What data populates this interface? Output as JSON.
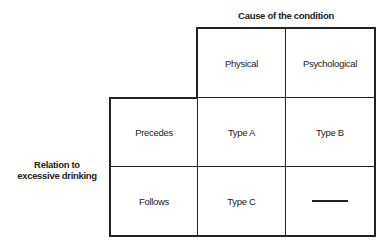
{
  "diagram": {
    "column_header_title": "Cause of the condition",
    "row_header_title_lines": [
      "Relation to",
      "excessive drinking"
    ],
    "columns": [
      "Physical",
      "Psychological"
    ],
    "rows": [
      {
        "label": "Precedes",
        "cells": [
          "Type A",
          "Type B"
        ]
      },
      {
        "label": "Follows",
        "cells": [
          "Type C",
          "—"
        ]
      }
    ],
    "empty_cell_marker": "dash",
    "line_color": "#222222",
    "text_color": "#222222"
  }
}
